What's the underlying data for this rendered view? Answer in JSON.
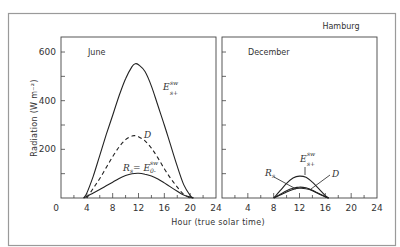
{
  "chart_data": [
    {
      "type": "line",
      "panel": "June",
      "title": "June",
      "xlabel": "Hour (true solar time)",
      "ylabel": "Radiation (W m^-2)",
      "xlim": [
        0,
        24
      ],
      "ylim": [
        0,
        650
      ],
      "xticks": [
        0,
        4,
        8,
        12,
        16,
        20,
        24
      ],
      "yticks": [
        0,
        200,
        400,
        600
      ],
      "grid": false,
      "series": [
        {
          "name": "E_s+^sw",
          "style": "solid",
          "x": [
            3.5,
            4,
            5,
            6,
            7,
            8,
            9,
            10,
            11,
            11.5,
            12,
            13,
            14,
            15,
            16,
            17,
            18,
            19,
            20,
            20.5
          ],
          "y": [
            0,
            20,
            90,
            175,
            260,
            340,
            420,
            490,
            540,
            552,
            548,
            520,
            460,
            380,
            300,
            215,
            130,
            55,
            10,
            0
          ]
        },
        {
          "name": "D",
          "style": "dashed",
          "x": [
            4,
            5,
            6,
            7,
            8,
            9,
            10,
            11,
            11.5,
            12,
            13,
            14,
            15,
            16,
            17,
            18,
            19,
            20
          ],
          "y": [
            0,
            40,
            80,
            125,
            170,
            210,
            240,
            255,
            256,
            252,
            235,
            205,
            165,
            120,
            80,
            45,
            15,
            0
          ]
        },
        {
          "name": "R_s = E_0-^sw",
          "style": "solid",
          "x": [
            3.5,
            5,
            6,
            7,
            8,
            9,
            10,
            11,
            12,
            13,
            14,
            15,
            16,
            17,
            18,
            19,
            20.5
          ],
          "y": [
            0,
            20,
            35,
            50,
            65,
            80,
            92,
            100,
            102,
            98,
            90,
            78,
            62,
            45,
            28,
            12,
            0
          ]
        }
      ],
      "annotations": [
        "June",
        "E_s+^sw",
        "D",
        "R_s = E_0-^sw"
      ]
    },
    {
      "type": "line",
      "panel": "December",
      "title": "December",
      "location": "Hamburg",
      "xlabel": "Hour (true solar time)",
      "xlim": [
        0,
        24
      ],
      "ylim": [
        0,
        650
      ],
      "xticks": [
        4,
        8,
        12,
        16,
        20,
        24
      ],
      "grid": false,
      "series": [
        {
          "name": "E_s+^sw",
          "style": "solid",
          "x": [
            8,
            9,
            10,
            11,
            12,
            13,
            14,
            15,
            16,
            16.5
          ],
          "y": [
            0,
            30,
            60,
            82,
            90,
            85,
            65,
            38,
            10,
            0
          ]
        },
        {
          "name": "D",
          "style": "solid",
          "x": [
            8,
            9,
            10,
            11,
            12,
            13,
            14,
            15,
            16,
            16.5
          ],
          "y": [
            0,
            15,
            30,
            40,
            45,
            42,
            32,
            18,
            5,
            0
          ]
        },
        {
          "name": "R_s",
          "style": "solid",
          "x": [
            8,
            9,
            10,
            11,
            12,
            13,
            14,
            15,
            16,
            16.5
          ],
          "y": [
            0,
            12,
            25,
            35,
            40,
            38,
            30,
            17,
            5,
            0
          ]
        }
      ],
      "annotations": [
        "December",
        "Hamburg",
        "E_s+^sw",
        "R_s",
        "D"
      ]
    }
  ],
  "labels": {
    "location": "Hamburg",
    "june": "June",
    "december": "December",
    "xlabel": "Hour (true solar time)",
    "ylabel": "Radiation (W m⁻²)",
    "ylabel_main": "Radiation",
    "ylabel_unit": "(W m",
    "ylabel_exp": "-2",
    "ylabel_close": ")",
    "june_E": "E",
    "june_E_sup": "sw",
    "june_E_sub": "s+",
    "june_D": "D",
    "june_Rs": "R",
    "june_Rs_sub": "s",
    "june_Rs_eq": " = E",
    "june_Rs_sup": "sw",
    "june_Rs_sub2": "0-",
    "dec_E": "E",
    "dec_E_sup": "sw",
    "dec_E_sub": "s+",
    "dec_D": "D",
    "dec_Rs": "R",
    "dec_Rs_sub": "s"
  },
  "colors": {
    "line": "#222222",
    "frame": "#888888",
    "text": "#333333",
    "background": "#ffffff"
  }
}
